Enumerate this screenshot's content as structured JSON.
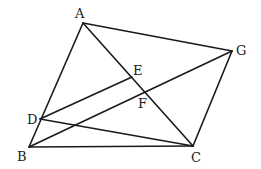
{
  "diagram": {
    "type": "geometry",
    "stroke_color": "#1a1a1a",
    "label_color": "#222222",
    "points": [
      {
        "id": "A",
        "label": "A",
        "x": 83,
        "y": 23,
        "lx": 75,
        "ly": 18
      },
      {
        "id": "G",
        "label": "G",
        "x": 232,
        "y": 51,
        "lx": 236,
        "ly": 55
      },
      {
        "id": "B",
        "label": "B",
        "x": 29,
        "y": 147,
        "lx": 17,
        "ly": 161
      },
      {
        "id": "C",
        "label": "C",
        "x": 193,
        "y": 146,
        "lx": 191,
        "ly": 162
      },
      {
        "id": "D",
        "label": "D",
        "x": 40,
        "y": 119,
        "lx": 27,
        "ly": 124
      },
      {
        "id": "E",
        "label": "E",
        "x": 132,
        "y": 77,
        "lx": 133,
        "ly": 75
      },
      {
        "id": "F",
        "label": "F",
        "x": 146,
        "y": 93,
        "lx": 138,
        "ly": 108
      }
    ],
    "segments": [
      {
        "from": "A",
        "to": "B"
      },
      {
        "from": "A",
        "to": "G"
      },
      {
        "from": "A",
        "to": "C"
      },
      {
        "from": "G",
        "to": "C"
      },
      {
        "from": "B",
        "to": "C"
      },
      {
        "from": "B",
        "to": "G"
      },
      {
        "from": "D",
        "to": "E"
      },
      {
        "from": "D",
        "to": "C"
      }
    ]
  }
}
